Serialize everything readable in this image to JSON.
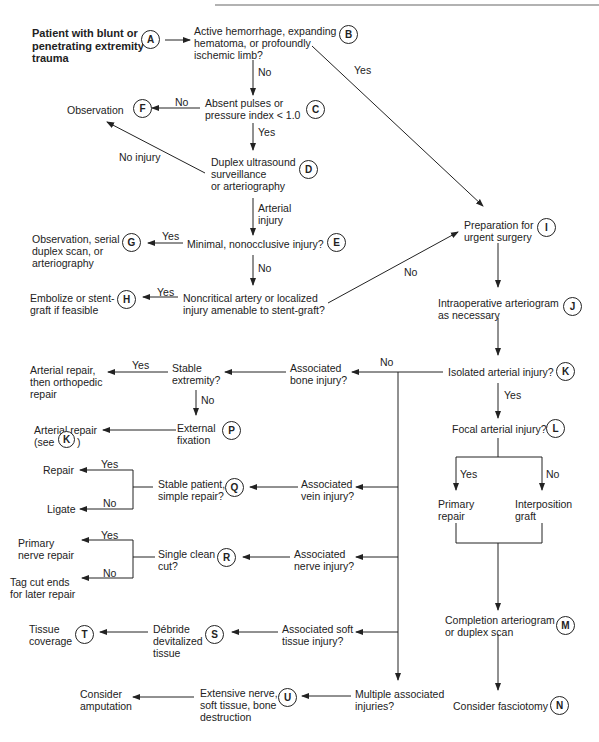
{
  "nodes": {
    "A": {
      "letter": "A",
      "text": "Patient with blunt or\npenetrating extremity\ntrauma"
    },
    "B": {
      "letter": "B",
      "text": "Active hemorrhage, expanding\nhematoma, or profoundly\nischemic limb?"
    },
    "C": {
      "letter": "C",
      "text": "Absent pulses or\npressure index < 1.0"
    },
    "D": {
      "letter": "D",
      "text": "Duplex ultrasound\nsurveillance\nor arteriography"
    },
    "E": {
      "letter": "E",
      "text": "Minimal, nonocclusive injury?"
    },
    "F": {
      "letter": "F",
      "text": "Observation"
    },
    "G": {
      "letter": "G",
      "text": "Observation, serial\nduplex scan, or\narteriography"
    },
    "H": {
      "letter": "H",
      "text": "Embolize or stent-\ngraft if feasible"
    },
    "H_q": {
      "text": "Noncritical artery or localized\ninjury amenable to stent-graft?"
    },
    "I": {
      "letter": "I",
      "text": "Preparation for\nurgent surgery"
    },
    "J": {
      "letter": "J",
      "text": "Intraoperative arteriogram\nas necessary"
    },
    "K": {
      "letter": "K",
      "text": "Isolated arterial injury?"
    },
    "L": {
      "letter": "L",
      "text": "Focal arterial injury?"
    },
    "primary_repair": {
      "text": "Primary\nrepair"
    },
    "interposition": {
      "text": "Interposition\ngraft"
    },
    "M": {
      "letter": "M",
      "text": "Completion arteriogram\nor duplex scan"
    },
    "N": {
      "letter": "N",
      "text": "Consider fasciotomy"
    },
    "bone": {
      "text": "Associated\nbone injury?"
    },
    "stable_ext": {
      "text": "Stable\nextremity?"
    },
    "art_ortho": {
      "text": "Arterial repair,\nthen orthopedic\nrepair"
    },
    "P": {
      "letter": "P",
      "text": "External\nfixation"
    },
    "art_see_k": {
      "text": "Arterial repair\n(see",
      "close": ")",
      "letter": "K"
    },
    "vein": {
      "text": "Associated\nvein injury?"
    },
    "Q": {
      "letter": "Q",
      "text": "Stable patient,\nsimple repair?"
    },
    "repair": {
      "text": "Repair"
    },
    "ligate": {
      "text": "Ligate"
    },
    "nerve": {
      "text": "Associated\nnerve injury?"
    },
    "R": {
      "letter": "R",
      "text": "Single clean\ncut?"
    },
    "primary_nerve": {
      "text": "Primary\nnerve repair"
    },
    "tag": {
      "text": "Tag cut ends\nfor later repair"
    },
    "soft": {
      "text": "Associated soft\ntissue injury?"
    },
    "S": {
      "letter": "S",
      "text": "Débride\ndevitalized\ntissue"
    },
    "T": {
      "letter": "T",
      "text": "Tissue\ncoverage"
    },
    "multiple": {
      "text": "Multiple associated\ninjuries?"
    },
    "U": {
      "letter": "U",
      "text": "Extensive nerve,\nsoft tissue, bone\ndestruction"
    },
    "amputation": {
      "text": "Consider\namputation"
    }
  },
  "edge_labels": {
    "yes": "Yes",
    "no": "No",
    "no_injury": "No injury",
    "arterial_injury": "Arterial\ninjury"
  }
}
